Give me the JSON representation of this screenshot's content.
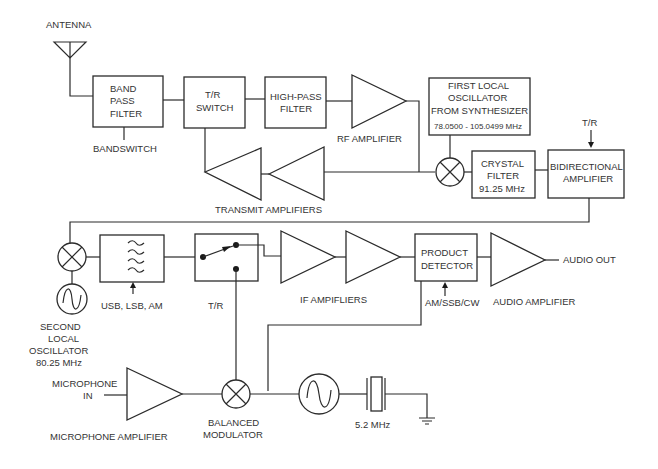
{
  "diagram": {
    "type": "block-diagram",
    "title": "",
    "colors": {
      "stroke": "#2b2b2b",
      "text": "#333333",
      "background": "#ffffff"
    },
    "labels": {
      "antenna": "ANTENNA",
      "band_pass_filter": [
        "BAND",
        "PASS",
        "FILTER"
      ],
      "bandswitch": "BANDSWITCH",
      "tr_switch": [
        "T/R",
        "SWITCH"
      ],
      "high_pass_filter": [
        "HIGH-PASS",
        "FILTER"
      ],
      "rf_amplifier": "RF AMPLIFIER",
      "first_lo": [
        "FIRST LOCAL",
        "OSCILLATOR",
        "FROM SYNTHESIZER"
      ],
      "first_lo_freq": "78.0500 - 105.0499 MHz",
      "tr_top": "T/R",
      "crystal_filter": [
        "CRYSTAL",
        "FILTER",
        "91.25 MHz"
      ],
      "bidirectional_amplifier": [
        "BIDIRECTIONAL",
        "AMPLIFIER"
      ],
      "transmit_amplifiers": "TRANSMIT  AMPLIFIERS",
      "mode_select": "USB, LSB, AM",
      "tr_mid": "T/R",
      "if_amplifiers": "IF AMPIFLIERS",
      "product_detector": [
        "PRODUCT",
        "DETECTOR"
      ],
      "detector_mode": "AM/SSB/CW",
      "audio_amplifier": "AUDIO AMPLIFIER",
      "audio_out": "AUDIO OUT",
      "second_lo": [
        "SECOND",
        "LOCAL",
        "OSCILLATOR",
        "80.25 MHz"
      ],
      "microphone_in": [
        "MICROPHONE",
        "IN"
      ],
      "microphone_amplifier": "MICROPHONE AMPLIFIER",
      "balanced_modulator": [
        "BALANCED",
        "MODULATOR"
      ],
      "crystal_freq": "5.2 MHz"
    },
    "nodes": [
      "antenna",
      "band-pass-filter",
      "tr-switch",
      "high-pass-filter",
      "rf-amplifier",
      "first-mixer",
      "first-local-oscillator",
      "crystal-filter",
      "bidirectional-amplifier",
      "transmit-amplifier-1",
      "transmit-amplifier-2",
      "second-mixer",
      "second-local-oscillator",
      "sideband-filter",
      "tr-relay",
      "if-amplifier-1",
      "if-amplifier-2",
      "product-detector",
      "audio-amplifier",
      "microphone-amplifier",
      "balanced-modulator",
      "carrier-oscillator",
      "crystal-5-2mhz",
      "ground"
    ]
  }
}
